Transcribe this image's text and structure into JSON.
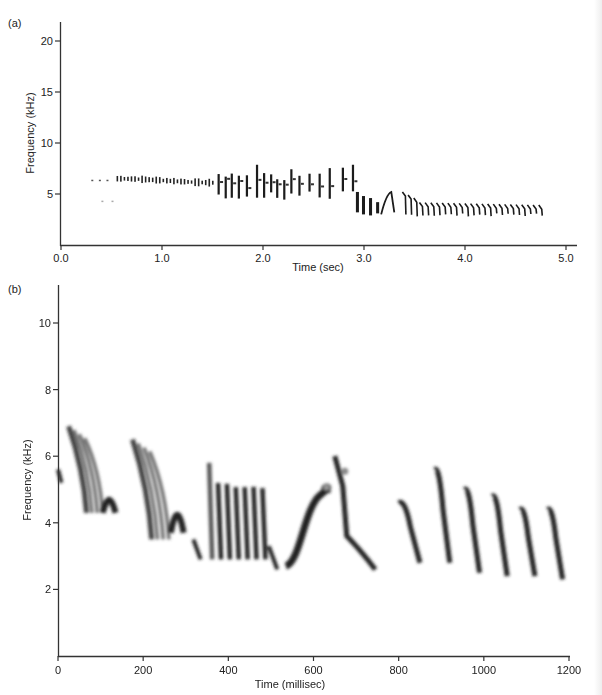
{
  "figure": {
    "panel_a_label": "(a)",
    "panel_b_label": "(b)"
  },
  "chart_data": [
    {
      "type": "heatmap",
      "panel": "(a)",
      "title": "",
      "xlabel": "Time (sec)",
      "ylabel": "Frequency (kHz)",
      "xlim": [
        0.0,
        5.1
      ],
      "ylim": [
        0,
        22
      ],
      "xticks": [
        0.0,
        1.0,
        2.0,
        3.0,
        4.0,
        5.0
      ],
      "xtick_labels": [
        "0.0",
        "1.0",
        "2.0",
        "3.0",
        "4.0",
        "5.0"
      ],
      "yticks": [
        5,
        10,
        15,
        20
      ],
      "ytick_labels": [
        "5",
        "10",
        "15",
        "20"
      ],
      "grid": false,
      "description": "Spectrogram of a full bird song: a trill around 6-7 kHz from ~0.3 s to ~1.5 s, a series of broadband notes peaking up to ~8 kHz between 1.5-3.0 s, descending toward ~3-4 kHz near 3.0-3.3 s, then a steady trill of ~25 repeated notes at ~3-4 kHz from ~3.4 s to ~4.75 s.",
      "elements": [
        {
          "t_start": 0.3,
          "t_end": 0.45,
          "f_low": 6.2,
          "f_high": 6.6,
          "kind": "dots"
        },
        {
          "t_start": 0.4,
          "t_end": 0.5,
          "f_low": 4.2,
          "f_high": 4.5,
          "kind": "faint"
        },
        {
          "t_start": 0.55,
          "t_end": 1.5,
          "f_low": 5.8,
          "f_high": 7.0,
          "kind": "trill"
        },
        {
          "t_start": 1.5,
          "t_end": 2.95,
          "f_low": 4.2,
          "f_high": 8.0,
          "kind": "broadband-notes"
        },
        {
          "t_start": 2.9,
          "t_end": 3.3,
          "f_low": 2.5,
          "f_high": 6.0,
          "kind": "descending-notes"
        },
        {
          "t_start": 3.4,
          "t_end": 4.75,
          "f_low": 2.7,
          "f_high": 5.5,
          "kind": "repeated-trill",
          "note_count": 25
        }
      ],
      "contour": {
        "x": [
          0.3,
          0.6,
          1.0,
          1.5,
          2.0,
          2.2,
          2.5,
          2.8,
          3.0,
          3.2,
          3.5,
          4.0,
          4.5,
          4.75
        ],
        "peak_freq_khz": [
          6.4,
          6.3,
          6.5,
          6.5,
          7.5,
          7.8,
          6.8,
          6.2,
          5.5,
          5.5,
          5.0,
          3.8,
          3.8,
          3.5
        ]
      }
    },
    {
      "type": "heatmap",
      "panel": "(b)",
      "title": "",
      "xlabel": "Time (millisec)",
      "ylabel": "Frequency (kHz)",
      "xlim": [
        0,
        1200
      ],
      "ylim": [
        0,
        11
      ],
      "xticks": [
        0,
        200,
        400,
        600,
        800,
        1000,
        1200
      ],
      "xtick_labels": [
        "0",
        "200",
        "400",
        "600",
        "800",
        "1000",
        "1200"
      ],
      "yticks": [
        2,
        4,
        6,
        8,
        10
      ],
      "ytick_labels": [
        "2",
        "4",
        "6",
        "8",
        "10"
      ],
      "grid": false,
      "description": "Expanded spectrogram of song syllables showing frequency-modulated notes between ~2.3 and ~6.9 kHz.",
      "syllables": [
        {
          "t_start": 0,
          "t_end": 8,
          "f_start": 5.6,
          "f_end": 5.2,
          "shape": "fragment"
        },
        {
          "t_start": 25,
          "t_end": 95,
          "f_start": 6.9,
          "f_end": 4.3,
          "shape": "descending-harmonic-stack"
        },
        {
          "t_start": 105,
          "t_end": 135,
          "f_start": 4.9,
          "f_end": 4.3,
          "shape": "arch"
        },
        {
          "t_start": 175,
          "t_end": 250,
          "f_start": 6.5,
          "f_end": 3.5,
          "shape": "descending-harmonic-stack"
        },
        {
          "t_start": 265,
          "t_end": 295,
          "f_start": 4.6,
          "f_end": 3.7,
          "shape": "arch"
        },
        {
          "t_start": 318,
          "t_end": 335,
          "f_start": 3.5,
          "f_end": 2.9,
          "shape": "short-descending"
        },
        {
          "t_start": 355,
          "t_end": 480,
          "f_start": 5.8,
          "f_end": 2.9,
          "shape": "pulsed-broadband"
        },
        {
          "t_start": 495,
          "t_end": 515,
          "f_start": 3.3,
          "f_end": 2.6,
          "shape": "short-descending"
        },
        {
          "t_start": 535,
          "t_end": 640,
          "f_start": 2.7,
          "f_end": 5.0,
          "shape": "rising-sweep"
        },
        {
          "t_start": 650,
          "t_end": 745,
          "f_start": 6.0,
          "f_end": 2.6,
          "shape": "descending-sweep-with-tail"
        },
        {
          "t_start": 800,
          "t_end": 850,
          "f_start": 4.6,
          "f_end": 2.8,
          "shape": "downsweep"
        },
        {
          "t_start": 885,
          "t_end": 920,
          "f_start": 5.6,
          "f_end": 2.8,
          "shape": "downsweep"
        },
        {
          "t_start": 955,
          "t_end": 990,
          "f_start": 5.0,
          "f_end": 2.5,
          "shape": "downsweep"
        },
        {
          "t_start": 1020,
          "t_end": 1055,
          "f_start": 4.8,
          "f_end": 2.4,
          "shape": "downsweep"
        },
        {
          "t_start": 1085,
          "t_end": 1120,
          "f_start": 4.4,
          "f_end": 2.4,
          "shape": "downsweep"
        },
        {
          "t_start": 1150,
          "t_end": 1185,
          "f_start": 4.4,
          "f_end": 2.3,
          "shape": "downsweep"
        }
      ]
    }
  ]
}
